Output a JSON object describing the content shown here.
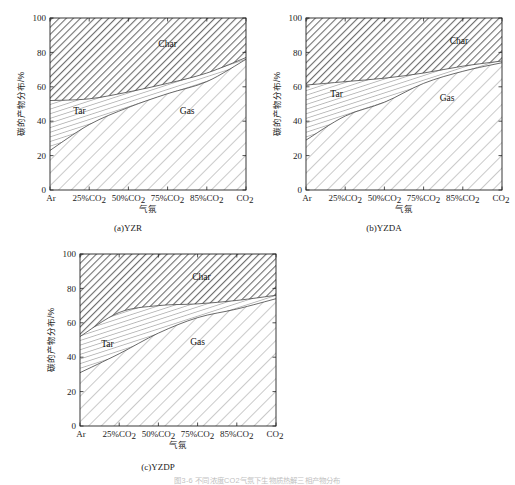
{
  "figure": {
    "bottom_caption": "图3-6  不同浓度CO2气氛下生物质热解三相产物分布"
  },
  "axis": {
    "y_title": "碳的产物分布/%",
    "x_title": "气氛",
    "y_ticks": [
      0,
      20,
      40,
      60,
      80,
      100
    ],
    "x_ticks": [
      "Ar",
      "25%CO",
      "50%CO",
      "75%CO",
      "85%CO",
      "CO"
    ],
    "x_tick_full": [
      "Ar",
      "25%CO2",
      "50%CO2",
      "75%CO2",
      "85%CO2",
      "CO2"
    ],
    "x_subscript": "2",
    "ylim": [
      0,
      100
    ]
  },
  "labels": {
    "char": "Char",
    "tar": "Tar",
    "gas": "Gas"
  },
  "panels": [
    {
      "id": "a",
      "caption": "(a)YZR"
    },
    {
      "id": "b",
      "caption": "(b)YZDA"
    },
    {
      "id": "c",
      "caption": "(c)YZDP"
    }
  ],
  "chart_data": [
    {
      "type": "area",
      "id": "a",
      "title": "(a)YZR",
      "xlabel": "气氛",
      "ylabel": "碳的产物分布/%",
      "ylim": [
        0,
        100
      ],
      "grid": false,
      "legend": "in-plot region labels",
      "categories": [
        "Ar",
        "25%CO2",
        "50%CO2",
        "75%CO2",
        "85%CO2",
        "CO2"
      ],
      "x_index": [
        0,
        1,
        2,
        3,
        4,
        5
      ],
      "series": [
        {
          "name": "Gas",
          "values": [
            23,
            38,
            48,
            56,
            63,
            76
          ]
        },
        {
          "name": "Tar",
          "values": [
            29,
            15,
            9,
            6,
            5,
            1
          ]
        },
        {
          "name": "Char",
          "values": [
            48,
            47,
            43,
            38,
            32,
            23
          ]
        }
      ],
      "cumulative_gas_top": [
        23,
        38,
        48,
        56,
        63,
        76
      ],
      "cumulative_tar_top": [
        52,
        53,
        57,
        62,
        68,
        77
      ]
    },
    {
      "type": "area",
      "id": "b",
      "title": "(b)YZDA",
      "xlabel": "气氛",
      "ylabel": "碳的产物分布/%",
      "ylim": [
        0,
        100
      ],
      "grid": false,
      "legend": "in-plot region labels",
      "categories": [
        "Ar",
        "25%CO2",
        "50%CO2",
        "75%CO2",
        "85%CO2",
        "CO2"
      ],
      "x_index": [
        0,
        1,
        2,
        3,
        4,
        5
      ],
      "series": [
        {
          "name": "Gas",
          "values": [
            29,
            43,
            51,
            62,
            69,
            74
          ]
        },
        {
          "name": "Tar",
          "values": [
            32,
            20,
            14,
            6,
            3,
            1
          ]
        },
        {
          "name": "Char",
          "values": [
            39,
            37,
            35,
            32,
            28,
            25
          ]
        }
      ],
      "cumulative_gas_top": [
        29,
        43,
        51,
        62,
        69,
        74
      ],
      "cumulative_tar_top": [
        61,
        63,
        65,
        68,
        72,
        75
      ]
    },
    {
      "type": "area",
      "id": "c",
      "title": "(c)YZDP",
      "xlabel": "气氛",
      "ylabel": "碳的产物分布/%",
      "ylim": [
        0,
        100
      ],
      "grid": false,
      "legend": "in-plot region labels",
      "categories": [
        "Ar",
        "25%CO2",
        "50%CO2",
        "75%CO2",
        "85%CO2",
        "CO2"
      ],
      "x_index": [
        0,
        1,
        2,
        3,
        4,
        5
      ],
      "series": [
        {
          "name": "Gas",
          "values": [
            31,
            42,
            54,
            63,
            68,
            74
          ]
        },
        {
          "name": "Tar",
          "values": [
            21,
            24,
            16,
            8,
            5,
            2
          ]
        },
        {
          "name": "Char",
          "values": [
            48,
            34,
            30,
            29,
            27,
            24
          ]
        }
      ],
      "cumulative_gas_top": [
        31,
        42,
        54,
        63,
        68,
        74
      ],
      "cumulative_tar_top": [
        52,
        66,
        70,
        71,
        73,
        76
      ]
    }
  ]
}
